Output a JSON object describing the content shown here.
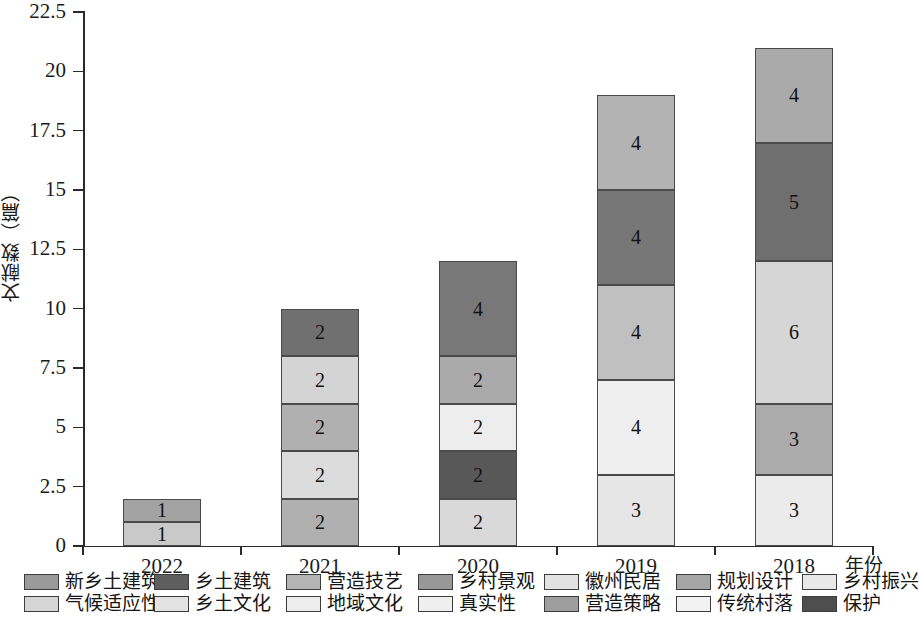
{
  "chart_data": {
    "type": "bar",
    "subtype": "stacked-bar",
    "title": "",
    "xlabel": "年份",
    "ylabel": "文献数（篇）",
    "categories": [
      "2022",
      "2021",
      "2020",
      "2019",
      "2018"
    ],
    "ylim": [
      0,
      22.5
    ],
    "ytick_labels": [
      "0",
      "2.5",
      "5",
      "7.5",
      "10",
      "12.5",
      "15",
      "17.5",
      "20",
      "22.5"
    ],
    "ytick_values": [
      0,
      2.5,
      5,
      7.5,
      10,
      12.5,
      15,
      17.5,
      20,
      22.5
    ],
    "grid": false,
    "legend_position": "below-axes",
    "totals": [
      2,
      10,
      12,
      19,
      21
    ],
    "stacks": [
      {
        "category": "2022",
        "segments": [
          {
            "label": "1",
            "value": 1,
            "color": "#c9c9c9",
            "series": "气候适应性"
          },
          {
            "label": "1",
            "value": 1,
            "color": "#a3a3a3",
            "series": "新乡土建筑"
          }
        ]
      },
      {
        "category": "2021",
        "segments": [
          {
            "label": "2",
            "value": 2,
            "color": "#b0b0b0",
            "series": "乡土文化"
          },
          {
            "label": "2",
            "value": 2,
            "color": "#dcdcdc",
            "series": "地域文化"
          },
          {
            "label": "2",
            "value": 2,
            "color": "#b0b0b0",
            "series": "营造技艺"
          },
          {
            "label": "2",
            "value": 2,
            "color": "#d4d4d4",
            "series": "真实性"
          },
          {
            "label": "2",
            "value": 2,
            "color": "#707070",
            "series": "乡土建筑"
          }
        ]
      },
      {
        "category": "2020",
        "segments": [
          {
            "label": "2",
            "value": 2,
            "color": "#d9d9d9",
            "series": "传统村落"
          },
          {
            "label": "2",
            "value": 2,
            "color": "#585858",
            "series": "保护"
          },
          {
            "label": "2",
            "value": 2,
            "color": "#ededed",
            "series": "乡村振兴"
          },
          {
            "label": "2",
            "value": 2,
            "color": "#aaaaaa",
            "series": "营造策略"
          },
          {
            "label": "4",
            "value": 4,
            "color": "#787878",
            "series": "规划设计"
          }
        ]
      },
      {
        "category": "2019",
        "segments": [
          {
            "label": "3",
            "value": 3,
            "color": "#e6e6e6",
            "series": "徽州民居"
          },
          {
            "label": "4",
            "value": 4,
            "color": "#efefef",
            "series": "乡村振兴"
          },
          {
            "label": "4",
            "value": 4,
            "color": "#c0c0c0",
            "series": "营造技艺"
          },
          {
            "label": "4",
            "value": 4,
            "color": "#777777",
            "series": "规划设计"
          },
          {
            "label": "4",
            "value": 4,
            "color": "#b3b3b3",
            "series": "乡村景观"
          }
        ]
      },
      {
        "category": "2018",
        "segments": [
          {
            "label": "3",
            "value": 3,
            "color": "#ebebeb",
            "series": "徽州民居"
          },
          {
            "label": "3",
            "value": 3,
            "color": "#ababab",
            "series": "乡村景观"
          },
          {
            "label": "6",
            "value": 6,
            "color": "#d6d6d6",
            "series": "地域文化"
          },
          {
            "label": "5",
            "value": 5,
            "color": "#6f6f6f",
            "series": "乡土建筑"
          },
          {
            "label": "4",
            "value": 4,
            "color": "#aaaaaa",
            "series": "新乡土建筑"
          }
        ]
      }
    ],
    "legend": [
      {
        "label": "新乡土建筑",
        "color": "#9a9a9a"
      },
      {
        "label": "乡土建筑",
        "color": "#5e5e5e"
      },
      {
        "label": "营造技艺",
        "color": "#b4b4b4"
      },
      {
        "label": "乡村景观",
        "color": "#989898"
      },
      {
        "label": "徽州民居",
        "color": "#e2e2e2"
      },
      {
        "label": "规划设计",
        "color": "#a5a5a5"
      },
      {
        "label": "乡村振兴",
        "color": "#e8e8e8"
      },
      {
        "label": "气候适应性",
        "color": "#d5d5d5"
      },
      {
        "label": "乡土文化",
        "color": "#e3e3e3"
      },
      {
        "label": "地域文化",
        "color": "#ededed"
      },
      {
        "label": "真实性",
        "color": "#efefef"
      },
      {
        "label": "营造策略",
        "color": "#9e9e9e"
      },
      {
        "label": "传统村落",
        "color": "#f2f2f2"
      },
      {
        "label": "保护",
        "color": "#4e4e4e"
      }
    ],
    "legend_rows": [
      [
        0,
        1,
        2,
        3,
        4,
        5,
        6
      ],
      [
        7,
        8,
        9,
        10,
        11,
        12,
        13
      ]
    ]
  }
}
